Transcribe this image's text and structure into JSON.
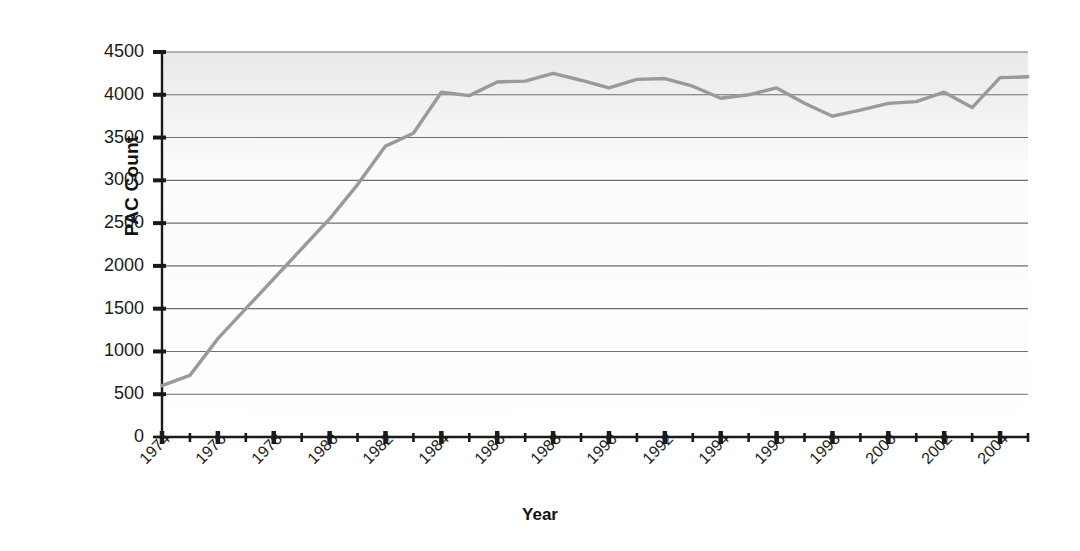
{
  "chart_data": {
    "type": "line",
    "title": "",
    "xlabel": "Year",
    "ylabel": "PAC Count",
    "xlim": [
      1974,
      2005
    ],
    "ylim": [
      0,
      4500
    ],
    "grid": true,
    "legend": "none",
    "line_color": "#9a9a9a",
    "axis_color": "#1a1a1a",
    "gridline_color": "#6e6e6e",
    "plot_background": "#fbfbfb",
    "y_ticks": [
      4500,
      4000,
      3500,
      3000,
      2500,
      2000,
      1500,
      1000,
      500,
      0
    ],
    "y_tick_labels": [
      "4500",
      "4000",
      "3500",
      "3000",
      "2500",
      "2000",
      "1500",
      "1000",
      "500",
      "0"
    ],
    "x_major_ticks": [
      1974,
      1976,
      1978,
      1980,
      1982,
      1984,
      1986,
      1988,
      1990,
      1992,
      1994,
      1996,
      1998,
      2000,
      2002,
      2004
    ],
    "x_major_tick_labels": [
      "1974",
      "1976",
      "1978",
      "1980",
      "1982",
      "1984",
      "1986",
      "1988",
      "1990",
      "1992",
      "1994",
      "1996",
      "1998",
      "2000",
      "2002",
      "2004"
    ],
    "x_minor_ticks": [
      1975,
      1977,
      1979,
      1981,
      1983,
      1985,
      1987,
      1989,
      1991,
      1993,
      1995,
      1997,
      1999,
      2001,
      2003,
      2005
    ],
    "x": [
      1974,
      1975,
      1976,
      1977,
      1978,
      1979,
      1980,
      1981,
      1982,
      1983,
      1984,
      1985,
      1986,
      1987,
      1988,
      1989,
      1990,
      1991,
      1992,
      1993,
      1994,
      1995,
      1996,
      1997,
      1998,
      1999,
      2000,
      2001,
      2002,
      2003,
      2004,
      2005
    ],
    "y": [
      600,
      720,
      1150,
      1500,
      1850,
      2200,
      2550,
      2950,
      3400,
      3550,
      4030,
      3990,
      4150,
      4160,
      4250,
      4170,
      4080,
      4180,
      4190,
      4100,
      3960,
      4000,
      4080,
      3900,
      3750,
      3820,
      3900,
      3920,
      4030,
      3850,
      4200,
      4210
    ],
    "series": [
      {
        "name": "PAC Count",
        "values": [
          600,
          720,
          1150,
          1500,
          1850,
          2200,
          2550,
          2950,
          3400,
          3550,
          4030,
          3990,
          4150,
          4160,
          4250,
          4170,
          4080,
          4180,
          4190,
          4100,
          3960,
          4000,
          4080,
          3900,
          3750,
          3820,
          3900,
          3920,
          4030,
          3850,
          4200,
          4210
        ]
      }
    ]
  }
}
